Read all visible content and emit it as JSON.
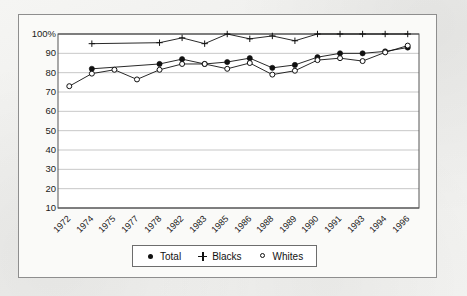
{
  "chart_data": {
    "type": "line",
    "title": "",
    "subtitle": "",
    "xlabel": "",
    "ylabel": "",
    "categories": [
      "1972",
      "1974",
      "1975",
      "1977",
      "1978",
      "1982",
      "1983",
      "1985",
      "1986",
      "1988",
      "1989",
      "1990",
      "1991",
      "1993",
      "1994",
      "1996"
    ],
    "ylim": [
      10,
      100
    ],
    "y_ticks": [
      10,
      20,
      30,
      40,
      50,
      60,
      70,
      80,
      90,
      100
    ],
    "y_tick_labels": [
      "10",
      "20",
      "30",
      "40",
      "50",
      "60",
      "70",
      "80",
      "90",
      "100%"
    ],
    "grid": "horizontal",
    "legend_position": "bottom",
    "series": [
      {
        "name": "Total",
        "marker": "filled-circle",
        "color": "#111111",
        "values": [
          null,
          82,
          null,
          null,
          84.5,
          87,
          84.5,
          85.5,
          87.5,
          82.5,
          84,
          88,
          90,
          90,
          91,
          93
        ]
      },
      {
        "name": "Blacks",
        "marker": "plus",
        "color": "#111111",
        "values": [
          null,
          95,
          null,
          null,
          95.5,
          98,
          95,
          100,
          97.5,
          99,
          96.5,
          100,
          100,
          100,
          100,
          100
        ]
      },
      {
        "name": "Whites",
        "marker": "open-circle",
        "color": "#111111",
        "values": [
          73,
          79.5,
          81.5,
          76.5,
          81.5,
          84.5,
          84.5,
          82,
          85,
          79,
          81,
          86.5,
          87.5,
          86,
          90.5,
          94
        ]
      }
    ]
  },
  "legend": {
    "items": [
      {
        "label": "Total",
        "marker": "filled-circle"
      },
      {
        "label": "Blacks",
        "marker": "plus"
      },
      {
        "label": "Whites",
        "marker": "open-circle"
      }
    ]
  },
  "colors": {
    "frame": "#8e8e8e",
    "axis": "#555555",
    "gridline": "#b9b9b9",
    "ink": "#111111",
    "page": "#f2f2f0"
  }
}
